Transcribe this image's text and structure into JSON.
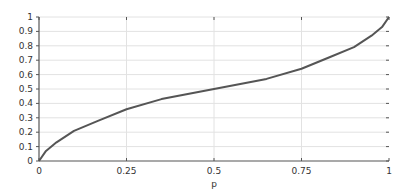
{
  "chart_data": {
    "type": "line",
    "title": "",
    "xlabel": "p",
    "ylabel": "",
    "xlim": [
      0,
      1
    ],
    "ylim": [
      0,
      1
    ],
    "grid": true,
    "legend": null,
    "x_ticks": [
      "0",
      "0.25",
      "0.5",
      "0.75",
      "1"
    ],
    "x_tick_values": [
      0,
      0.25,
      0.5,
      0.75,
      1
    ],
    "y_ticks": [
      "0",
      "0.1",
      "0.2",
      "0.3",
      "0.4",
      "0.5",
      "0.6",
      "0.7",
      "0.8",
      "0.9",
      "1"
    ],
    "y_tick_values": [
      0,
      0.1,
      0.2,
      0.3,
      0.4,
      0.5,
      0.6,
      0.7,
      0.8,
      0.9,
      1
    ],
    "series": [
      {
        "name": "curve",
        "color": "#555555",
        "x": [
          0,
          0.02,
          0.05,
          0.1,
          0.17,
          0.25,
          0.35,
          0.5,
          0.65,
          0.75,
          0.83,
          0.9,
          0.95,
          0.98,
          1
        ],
        "y": [
          0,
          0.07,
          0.13,
          0.21,
          0.28,
          0.36,
          0.43,
          0.5,
          0.57,
          0.64,
          0.72,
          0.79,
          0.87,
          0.93,
          1
        ]
      }
    ]
  },
  "colors": {
    "grid": "#e2e2e2",
    "axis": "#555555",
    "line": "#555555",
    "text": "#333333"
  }
}
